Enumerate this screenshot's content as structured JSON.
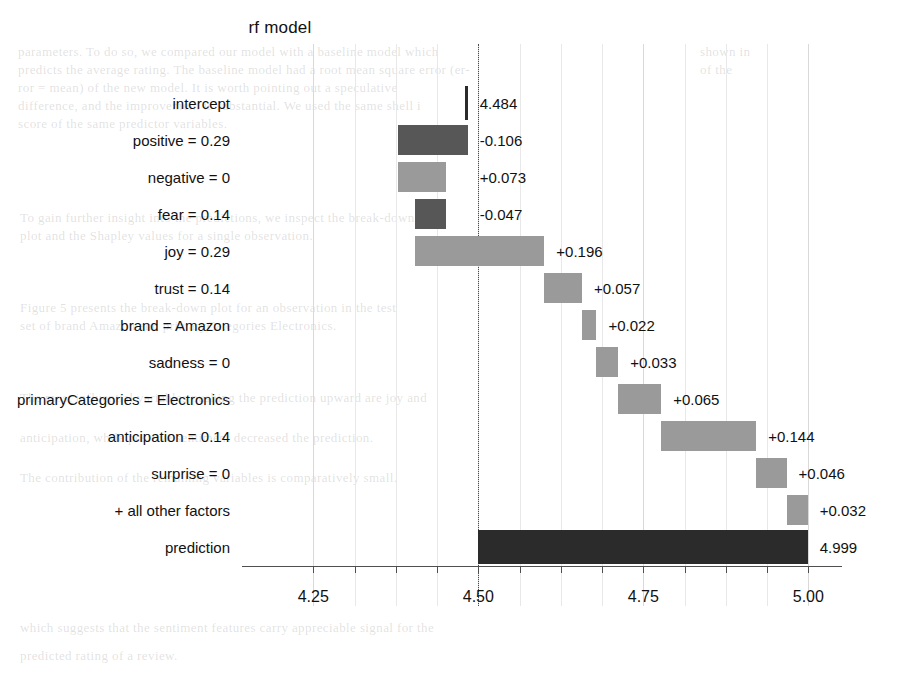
{
  "chart_data": {
    "type": "bar",
    "chart_subtype": "waterfall-breakdown",
    "title": "rf  model",
    "xlabel": "",
    "ylabel": "",
    "xlim": [
      4.142,
      5.051
    ],
    "grid": true,
    "legend": null,
    "x_ticks": [
      {
        "value": 4.25,
        "label": "4.25"
      },
      {
        "value": 4.5,
        "label": "4.50"
      },
      {
        "value": 4.75,
        "label": "4.75"
      },
      {
        "value": 5.0,
        "label": "5.00"
      }
    ],
    "x_minor_ticks": [
      4.3125,
      4.375,
      4.4375,
      4.5625,
      4.625,
      4.6875,
      4.8125,
      4.875,
      4.9375
    ],
    "baseline": 4.484,
    "categories": [
      "intercept",
      "positive = 0.29",
      "negative = 0",
      "fear = 0.14",
      "joy = 0.29",
      "trust = 0.14",
      "brand = Amazon",
      "sadness = 0",
      "primaryCategories = Electronics",
      "anticipation = 0.14",
      "surprise = 0",
      "+ all other factors",
      "prediction"
    ],
    "rows": [
      {
        "label": "intercept",
        "value_label": "4.484",
        "contribution": 0.0,
        "start": 4.484,
        "end": 4.484,
        "kind": "intercept"
      },
      {
        "label": "positive = 0.29",
        "value_label": "-0.106",
        "contribution": -0.106,
        "start": 4.484,
        "end": 4.378,
        "kind": "negative"
      },
      {
        "label": "negative = 0",
        "value_label": "+0.073",
        "contribution": 0.073,
        "start": 4.378,
        "end": 4.451,
        "kind": "positive"
      },
      {
        "label": "fear = 0.14",
        "value_label": "-0.047",
        "contribution": -0.047,
        "start": 4.451,
        "end": 4.404,
        "kind": "negative"
      },
      {
        "label": "joy = 0.29",
        "value_label": "+0.196",
        "contribution": 0.196,
        "start": 4.404,
        "end": 4.6,
        "kind": "positive"
      },
      {
        "label": "trust = 0.14",
        "value_label": "+0.057",
        "contribution": 0.057,
        "start": 4.6,
        "end": 4.657,
        "kind": "positive"
      },
      {
        "label": "brand = Amazon",
        "value_label": "+0.022",
        "contribution": 0.022,
        "start": 4.657,
        "end": 4.679,
        "kind": "positive"
      },
      {
        "label": "sadness = 0",
        "value_label": "+0.033",
        "contribution": 0.033,
        "start": 4.679,
        "end": 4.712,
        "kind": "positive"
      },
      {
        "label": "primaryCategories = Electronics",
        "value_label": "+0.065",
        "contribution": 0.065,
        "start": 4.712,
        "end": 4.777,
        "kind": "positive"
      },
      {
        "label": "anticipation = 0.14",
        "value_label": "+0.144",
        "contribution": 0.144,
        "start": 4.777,
        "end": 4.921,
        "kind": "positive"
      },
      {
        "label": "surprise = 0",
        "value_label": "+0.046",
        "contribution": 0.046,
        "start": 4.921,
        "end": 4.967,
        "kind": "positive"
      },
      {
        "label": "+ all other factors",
        "value_label": "+0.032",
        "contribution": 0.032,
        "start": 4.967,
        "end": 4.999,
        "kind": "positive"
      },
      {
        "label": "prediction",
        "value_label": "4.999",
        "contribution": 4.999,
        "start": 4.5,
        "end": 4.999,
        "kind": "total"
      }
    ]
  },
  "colors": {
    "positive": "#9a9a9a",
    "negative": "#575757",
    "total": "#2b2b2b",
    "intercept": "#2b2b2b",
    "grid": "#d9d9d9",
    "axis": "#4f4f4f",
    "text": "#111111"
  },
  "ghost": {
    "lines": [
      {
        "x": 18,
        "y": 44,
        "text": "parameters. To do so, we compared our model with a baseline model which"
      },
      {
        "x": 18,
        "y": 62,
        "text": "predicts the average rating. The baseline model had a root mean square error (er-"
      },
      {
        "x": 18,
        "y": 80,
        "text": "ror = mean) of the new model. It is worth pointing out a speculative"
      },
      {
        "x": 18,
        "y": 98,
        "text": "difference, and the improvement is substantial. We used the same shell i"
      },
      {
        "x": 18,
        "y": 116,
        "text": "score of the same predictor variables."
      },
      {
        "x": 700,
        "y": 44,
        "text": "shown in"
      },
      {
        "x": 700,
        "y": 62,
        "text": "of the"
      },
      {
        "x": 20,
        "y": 210,
        "text": "To gain further insight into the predictions, we inspect the break-down"
      },
      {
        "x": 20,
        "y": 228,
        "text": "plot and the Shapley values for a single observation."
      },
      {
        "x": 20,
        "y": 300,
        "text": "Figure 5 presents the break-down plot for an observation in the test"
      },
      {
        "x": 20,
        "y": 318,
        "text": "set of brand Amazon and primaryCategories Electronics."
      },
      {
        "x": 20,
        "y": 390,
        "text": "The most influential variables pushing the prediction upward are joy and"
      },
      {
        "x": 20,
        "y": 430,
        "text": "anticipation, while positive sentiment decreased the prediction."
      },
      {
        "x": 20,
        "y": 470,
        "text": "The contribution of the remaining variables is comparatively small."
      },
      {
        "x": 20,
        "y": 620,
        "text": "which suggests that the sentiment features carry appreciable signal for the"
      },
      {
        "x": 20,
        "y": 648,
        "text": "predicted rating of a review."
      }
    ]
  }
}
